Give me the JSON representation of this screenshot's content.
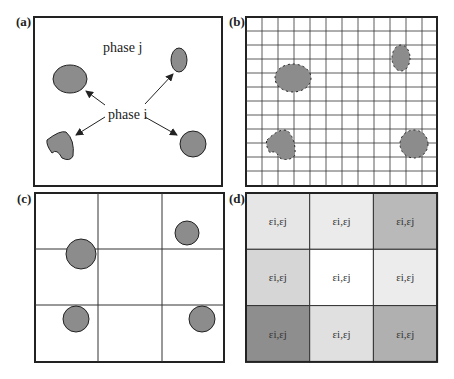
{
  "panels": {
    "a": {
      "label": "(a)",
      "phase_j": "phase j",
      "phase_i": "phase i"
    },
    "b": {
      "label": "(b)",
      "grid_cols": 12,
      "grid_rows": 12
    },
    "c": {
      "label": "(c)",
      "grid_cols": 3,
      "grid_rows": 3
    },
    "d": {
      "label": "(d)",
      "cells": [
        {
          "text": "εi,εj",
          "fill": "#e6e6e6"
        },
        {
          "text": "εi,εj",
          "fill": "#ebebeb"
        },
        {
          "text": "εi,εj",
          "fill": "#b9b9b9"
        },
        {
          "text": "εi,εj",
          "fill": "#d6d6d6"
        },
        {
          "text": "εi,εj",
          "fill": "#ffffff"
        },
        {
          "text": "εi,εj",
          "fill": "#ececec"
        },
        {
          "text": "εi,εj",
          "fill": "#8e8e8e"
        },
        {
          "text": "εi,εj",
          "fill": "#e0e0e0"
        },
        {
          "text": "εi,εj",
          "fill": "#b0b0b0"
        }
      ]
    }
  },
  "colors": {
    "particle": "#8c8c8c",
    "border": "#222222",
    "grid": "#333333"
  }
}
